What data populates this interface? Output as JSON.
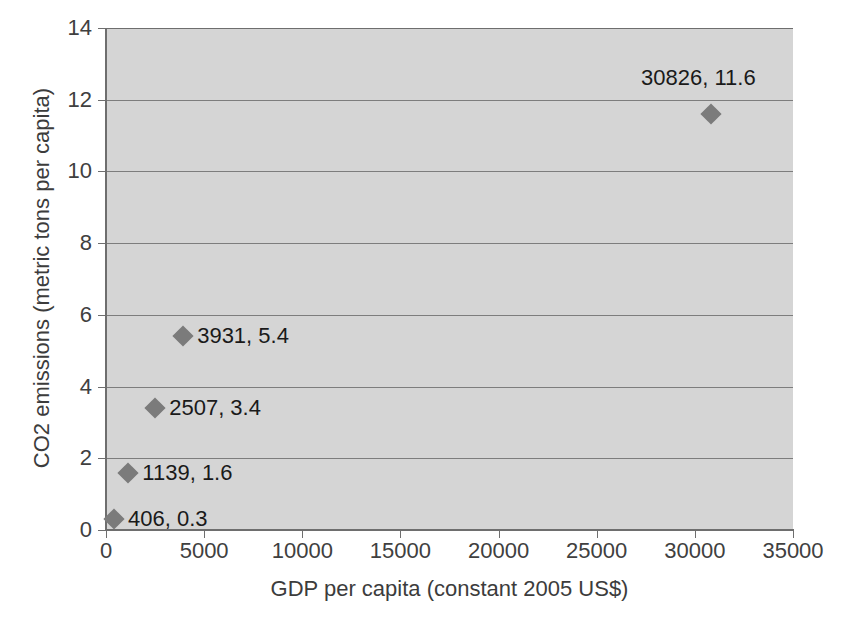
{
  "chart_data": {
    "type": "scatter",
    "title": "",
    "xlabel": "GDP per capita (constant 2005 US$)",
    "ylabel": "CO2 emissions (metric tons per capita)",
    "xlim": [
      0,
      35000
    ],
    "ylim": [
      0,
      14
    ],
    "xticks": [
      0,
      5000,
      10000,
      15000,
      20000,
      25000,
      30000,
      35000
    ],
    "xticklabels": [
      "0",
      "5000",
      "10000",
      "15000",
      "20000",
      "25000",
      "30000",
      "35000"
    ],
    "yticks": [
      0,
      2,
      4,
      6,
      8,
      10,
      12,
      14
    ],
    "yticklabels": [
      "0",
      "2",
      "4",
      "6",
      "8",
      "10",
      "12",
      "14"
    ],
    "grid": "horizontal",
    "legend": "none",
    "plot_background": "#d5d5d5",
    "marker_color": "#7b7b7b",
    "marker_shape": "diamond",
    "points": [
      {
        "x": 406,
        "y": 0.3,
        "label": "406, 0.3",
        "label_side": "right"
      },
      {
        "x": 1139,
        "y": 1.6,
        "label": "1139, 1.6",
        "label_side": "right"
      },
      {
        "x": 2507,
        "y": 3.4,
        "label": "2507, 3.4",
        "label_side": "right"
      },
      {
        "x": 3931,
        "y": 5.4,
        "label": "3931, 5.4",
        "label_side": "right"
      },
      {
        "x": 30826,
        "y": 11.6,
        "label": "30826, 11.6",
        "label_side": "above"
      }
    ]
  }
}
